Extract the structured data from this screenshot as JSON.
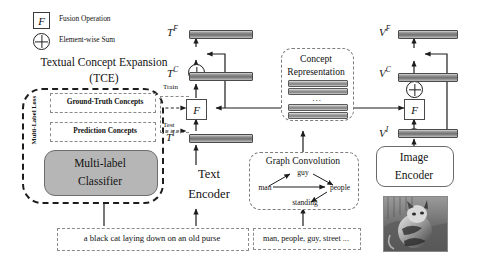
{
  "legend": {
    "fusion_symbol": "F",
    "fusion_label": "Fusion Operation",
    "sum_symbol": "⊕",
    "sum_label": "Element-wise Sum"
  },
  "tce": {
    "title_line1": "Textual Concept Expansion",
    "title_line2": "(TCE)",
    "loss_label": "Multi-Label Loss",
    "ground_truth_label": "Ground-Truth Concepts",
    "prediction_label": "Prediction Concepts",
    "classifier_line1": "Multi-label",
    "classifier_line2": "Classifier"
  },
  "text_branch": {
    "tf_label": "T",
    "tf_sup": "F",
    "tc_label": "T",
    "tc_sup": "C",
    "ti_label": "T",
    "ti_sup": "I",
    "train_label": "Train",
    "test_label": "Test",
    "fusion_symbol": "F",
    "encoder_line1": "Text",
    "encoder_line2": "Encoder",
    "caption": "a black cat laying down on an old purse"
  },
  "concept": {
    "title_line1": "Concept",
    "title_line2": "Representation",
    "ellipsis": "...",
    "bar_count": 4
  },
  "graph": {
    "title": "Graph Convolution",
    "nodes": [
      "guy",
      "man",
      "people",
      "standing"
    ],
    "concept_list": "man, people, guy, street ..."
  },
  "image_branch": {
    "vf_label": "V",
    "vf_sup": "F",
    "vc_label": "V",
    "vc_sup": "C",
    "vi_label": "V",
    "vi_sup": "I",
    "fusion_symbol": "F",
    "encoder_line1": "Image",
    "encoder_line2": "Encoder",
    "photo_alt": "cat-photo"
  },
  "colors": {
    "ink": "#121212",
    "bar_dark": "#6f6f6f",
    "classifier_fill": "#b6b6b6",
    "dashed": "#7d7d7d"
  }
}
